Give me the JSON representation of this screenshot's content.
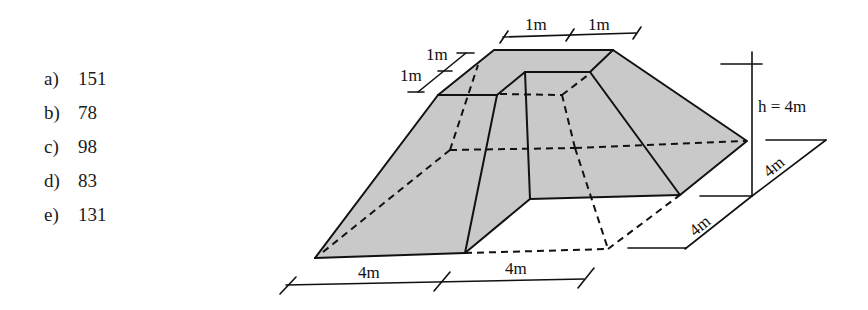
{
  "question": {
    "choices": [
      {
        "label": "a)",
        "value": "151"
      },
      {
        "label": "b)",
        "value": "78"
      },
      {
        "label": "c)",
        "value": "98"
      },
      {
        "label": "d)",
        "value": "83"
      },
      {
        "label": "e)",
        "value": "131"
      }
    ]
  },
  "figure": {
    "fill_color": "#c9c9c9",
    "dimensions": {
      "top_width_1": "1m",
      "top_width_2": "1m",
      "top_depth_1": "1m",
      "top_depth_2": "1m",
      "height": "h = 4m",
      "base_right_depth": "4m",
      "base_right_width": "4m",
      "base_front_1": "4m",
      "base_front_2": "4m"
    }
  }
}
